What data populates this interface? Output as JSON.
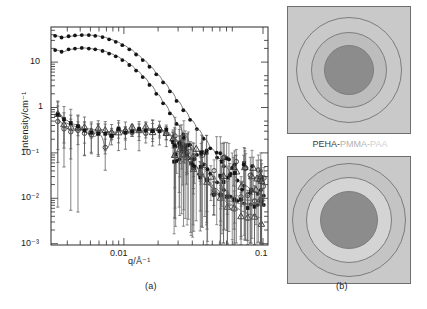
{
  "figure": {
    "panel_a_caption": "(a)",
    "panel_b_caption": "(b)"
  },
  "chart_data": {
    "type": "scatter",
    "title": "",
    "xlabel": "q/Å⁻¹",
    "ylabel": "Intensity/cm⁻¹",
    "xscale": "log",
    "yscale": "log",
    "xlim": [
      0.005,
      0.105
    ],
    "ylim": [
      0.001,
      40
    ],
    "grid": false,
    "legend_position": "none",
    "xticks_major": [
      0.01,
      0.1
    ],
    "xtick_labels": [
      "0.01",
      "0.1"
    ],
    "yticks_major": [
      10,
      1,
      0.1,
      0.01,
      0.001
    ],
    "ytick_labels": [
      "10",
      "1",
      "10⁻¹",
      "10⁻²",
      "10⁻³"
    ],
    "series": [
      {
        "name": "upper-curve-filled-circles",
        "marker": "filled-circle",
        "has_fit_line": true,
        "x": [
          0.0053,
          0.0058,
          0.0064,
          0.007,
          0.0077,
          0.0085,
          0.0093,
          0.0103,
          0.0113,
          0.0124,
          0.0136,
          0.015,
          0.0165,
          0.0181,
          0.0199,
          0.0219,
          0.0241,
          0.0265,
          0.0291,
          0.032,
          0.0352,
          0.0387,
          0.0425,
          0.0467,
          0.0514,
          0.0565,
          0.0621,
          0.0683,
          0.0751,
          0.0826,
          0.0908,
          0.099
        ],
        "y": [
          26.0,
          24.0,
          25.5,
          26.5,
          27.0,
          27.0,
          26.0,
          24.5,
          22.0,
          19.5,
          16.5,
          13.5,
          10.5,
          8.0,
          5.8,
          4.0,
          2.7,
          1.75,
          1.1,
          0.7,
          0.44,
          0.28,
          0.175,
          0.11,
          0.07,
          0.046,
          0.032,
          0.023,
          0.018,
          0.014,
          0.012,
          0.011
        ]
      },
      {
        "name": "second-curve-filled-circles",
        "marker": "filled-circle",
        "has_fit_line": true,
        "x": [
          0.0053,
          0.0058,
          0.0064,
          0.007,
          0.0077,
          0.0085,
          0.0093,
          0.0103,
          0.0113,
          0.0124,
          0.0136,
          0.015,
          0.0165,
          0.0181,
          0.0199,
          0.0219,
          0.0241,
          0.0265,
          0.0291,
          0.032,
          0.0352,
          0.0387,
          0.0425,
          0.0467,
          0.0514,
          0.0565,
          0.0621,
          0.0683,
          0.0751,
          0.0826,
          0.0908,
          0.099
        ],
        "y": [
          13.0,
          12.0,
          13.5,
          14.0,
          14.5,
          14.0,
          13.5,
          12.5,
          11.0,
          9.6,
          8.0,
          6.3,
          4.8,
          3.5,
          2.4,
          1.55,
          0.98,
          0.6,
          0.36,
          0.215,
          0.13,
          0.08,
          0.05,
          0.032,
          0.021,
          0.0145,
          0.0105,
          0.0085,
          0.0075,
          0.0072,
          0.007,
          0.007
        ]
      },
      {
        "name": "lower-curve-open-circles",
        "marker": "open-circle",
        "has_error_bars": true,
        "has_fit_line": true,
        "x": [
          0.0055,
          0.006,
          0.0066,
          0.0073,
          0.008,
          0.0088,
          0.0097,
          0.0107,
          0.0117,
          0.0129,
          0.0142,
          0.0156,
          0.0172,
          0.0189,
          0.0208,
          0.0229,
          0.0252,
          0.0277,
          0.0305,
          0.0335,
          0.0369,
          0.0406,
          0.0446,
          0.0491,
          0.054,
          0.0594,
          0.0653,
          0.0719,
          0.079,
          0.0869,
          0.0956
        ],
        "y": [
          0.42,
          0.3,
          0.26,
          0.28,
          0.24,
          0.19,
          0.22,
          0.105,
          0.21,
          0.26,
          0.24,
          0.26,
          0.25,
          0.26,
          0.27,
          0.25,
          0.22,
          0.17,
          0.115,
          0.075,
          0.048,
          0.032,
          0.022,
          0.016,
          0.012,
          0.01,
          0.0095,
          0.009,
          0.0088,
          0.009,
          0.0092
        ]
      },
      {
        "name": "lower-curve-open-triangles",
        "marker": "open-triangle",
        "has_error_bars": true,
        "has_fit_line": true,
        "x": [
          0.0055,
          0.006,
          0.0066,
          0.0073,
          0.008,
          0.0088,
          0.0097,
          0.0107,
          0.0117,
          0.0129,
          0.0142,
          0.0156,
          0.0172,
          0.0189,
          0.0208,
          0.0229,
          0.0252,
          0.0277,
          0.0305,
          0.0335,
          0.0369,
          0.0406,
          0.0446,
          0.0491,
          0.054,
          0.0594,
          0.0653,
          0.0719,
          0.079,
          0.0869,
          0.0956
        ],
        "y": [
          0.55,
          0.38,
          0.33,
          0.3,
          0.29,
          0.27,
          0.28,
          0.25,
          0.24,
          0.26,
          0.25,
          0.27,
          0.26,
          0.28,
          0.29,
          0.27,
          0.24,
          0.185,
          0.125,
          0.08,
          0.05,
          0.031,
          0.019,
          0.013,
          0.0095,
          0.0075,
          0.0062,
          0.0052,
          0.0045,
          0.004,
          0.0036
        ]
      },
      {
        "name": "lower-curve-filled-squares",
        "marker": "filled-square",
        "has_error_bars": true,
        "has_fit_line": true,
        "x": [
          0.0055,
          0.006,
          0.0066,
          0.0073,
          0.008,
          0.0088,
          0.0097,
          0.0107,
          0.0117,
          0.0129,
          0.0142,
          0.0156,
          0.0172,
          0.0189,
          0.0208,
          0.0229,
          0.0252,
          0.0277,
          0.0305,
          0.0335,
          0.0369,
          0.0406,
          0.0446,
          0.0491,
          0.054,
          0.0594,
          0.0653,
          0.0719,
          0.079,
          0.0869,
          0.0956
        ],
        "y": [
          0.6,
          0.44,
          0.36,
          0.33,
          0.26,
          0.24,
          0.25,
          0.22,
          0.23,
          0.25,
          0.24,
          0.26,
          0.25,
          0.27,
          0.28,
          0.26,
          0.23,
          0.175,
          0.12,
          0.078,
          0.049,
          0.03,
          0.02,
          0.014,
          0.0105,
          0.0085,
          0.0078,
          0.0072,
          0.007,
          0.0075,
          0.0085
        ]
      }
    ]
  },
  "panel_b": {
    "structure_label": {
      "segment_1": "PEHA-",
      "segment_2": "PMMA-",
      "segment_3": "PAA"
    },
    "top_diagram": {
      "name": "core-shell-corona-micelle-top",
      "core_color": "#8c8c8c",
      "shell_color": "#bdbdbd",
      "corona_color": "#c9c9c9",
      "background_color": "#c9c9c9"
    },
    "bottom_diagram": {
      "name": "core-shell-corona-micelle-bottom",
      "core_color": "#8c8c8c",
      "shell_color": "#d4d4d4",
      "corona_color": "#c4c4c4",
      "background_color": "#c4c4c4"
    }
  }
}
